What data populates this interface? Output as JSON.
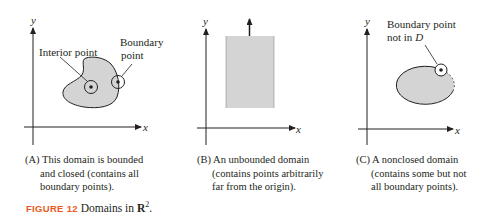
{
  "figure": {
    "number_label": "FIGURE 12",
    "title_text": "Domains in ",
    "title_math": "R",
    "title_sup": "2",
    "title_end": ".",
    "accent_color": "#ea5a1e",
    "fill_color": "#d4d4d4"
  },
  "panels": [
    {
      "id": "A",
      "axis_x": "x",
      "axis_y": "y",
      "labels": {
        "interior": "Interior point",
        "boundary_line1": "Boundary",
        "boundary_line2": "point"
      },
      "caption": [
        "(A) This domain is bounded",
        "and closed (contains all",
        "boundary points)."
      ]
    },
    {
      "id": "B",
      "axis_x": "x",
      "axis_y": "y",
      "caption": [
        "(B) An unbounded domain",
        "(contains points arbitrarily",
        "far from the origin)."
      ]
    },
    {
      "id": "C",
      "axis_x": "x",
      "axis_y": "y",
      "labels": {
        "line1": "Boundary point",
        "line2_prefix": "not in ",
        "line2_symbol": "D"
      },
      "caption": [
        "(C) A nonclosed domain",
        "(contains some but not",
        "all boundary points)."
      ]
    }
  ]
}
